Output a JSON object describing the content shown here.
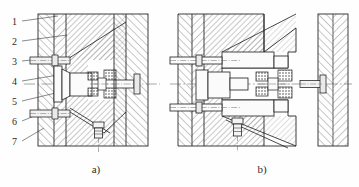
{
  "figure": {
    "type": "engineering-sectional-drawing",
    "background_color": "#fefefe",
    "line_color": "#1d1d1d",
    "hatch_color": "#4a4a4a",
    "centerline_color": "#6b6b6b"
  },
  "captions": {
    "a": "a)",
    "b": "b)"
  },
  "callouts": {
    "description": "Numbered item balloons with leader lines, left margin of view a)",
    "items": [
      {
        "number": "1",
        "x": 12,
        "y": 24,
        "leader_to_x": 58,
        "leader_to_y": 16
      },
      {
        "number": "2",
        "x": 12,
        "y": 44,
        "leader_to_x": 67,
        "leader_to_y": 35
      },
      {
        "number": "3",
        "x": 12,
        "y": 64,
        "leader_to_x": 40,
        "leader_to_y": 60
      },
      {
        "number": "4",
        "x": 12,
        "y": 84,
        "leader_to_x": 56,
        "leader_to_y": 76
      },
      {
        "number": "5",
        "x": 12,
        "y": 104,
        "leader_to_x": 63,
        "leader_to_y": 92
      },
      {
        "number": "6",
        "x": 12,
        "y": 124,
        "leader_to_x": 39,
        "leader_to_y": 113
      },
      {
        "number": "7",
        "x": 12,
        "y": 144,
        "leader_to_x": 44,
        "leader_to_y": 128
      }
    ]
  },
  "view_a": {
    "label": "a)",
    "caption_x": 96,
    "caption_y": 172,
    "block": {
      "x": 38,
      "y": 14,
      "w": 110,
      "h": 132
    },
    "centerline_y": 84,
    "plates": [
      {
        "name": "backing-plate",
        "x": 38,
        "y": 14,
        "w": 16,
        "h": 132
      },
      {
        "name": "support-plate",
        "x": 54,
        "y": 14,
        "w": 12,
        "h": 132
      },
      {
        "name": "cavity-plate",
        "x": 66,
        "y": 14,
        "w": 48,
        "h": 132
      },
      {
        "name": "core-plate",
        "x": 114,
        "y": 14,
        "w": 12,
        "h": 132
      },
      {
        "name": "clamp-plate",
        "x": 126,
        "y": 14,
        "w": 22,
        "h": 132
      }
    ],
    "top_pin": {
      "x": 30,
      "y": 57,
      "w": 40,
      "h": 7
    },
    "bottom_pin": {
      "x": 30,
      "y": 110,
      "w": 40,
      "h": 7
    },
    "insert": {
      "x": 88,
      "y": 72,
      "w": 44,
      "h": 24
    },
    "ejector_screw": {
      "x": 94,
      "y": 124,
      "w": 9,
      "h": 18
    }
  },
  "view_b": {
    "label": "b)",
    "caption_x": 262,
    "caption_y": 172,
    "block": {
      "x": 178,
      "y": 14,
      "w": 118,
      "h": 132
    },
    "centerline_y": 84,
    "detached_plate": {
      "x": 318,
      "y": 14,
      "w": 30,
      "h": 132
    },
    "detached_pin": {
      "x": 300,
      "y": 80,
      "w": 34,
      "h": 7
    },
    "floating_insert": {
      "x": 254,
      "y": 72,
      "w": 40,
      "h": 24
    },
    "core_boss": {
      "x": 196,
      "y": 72,
      "w": 52,
      "h": 26
    },
    "slide_top": {
      "x": 222,
      "y": 52,
      "w": 66,
      "h": 16
    },
    "slide_bottom": {
      "x": 222,
      "y": 100,
      "w": 66,
      "h": 16
    },
    "ejector_screw": {
      "x": 234,
      "y": 120,
      "w": 9,
      "h": 22
    }
  },
  "hatching": {
    "steel_angle_right": 45,
    "steel_angle_left": -45,
    "spacing_px": 4,
    "stroke_width": 0.6,
    "elastomer_pattern": "stippled-dots"
  }
}
